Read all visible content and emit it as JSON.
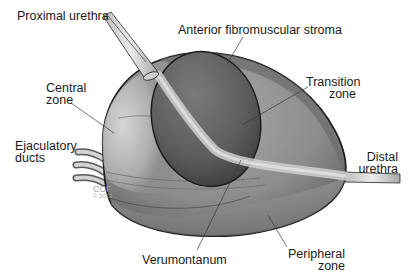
{
  "diagram": {
    "labels": {
      "proximal_urethra": "Proximal urethra",
      "anterior_fibromuscular_stroma": "Anterior fibromuscular stroma",
      "central_zone_line1": "Central",
      "central_zone_line2": "zone",
      "transition_zone_line1": "Transition",
      "transition_zone_line2": "zone",
      "ejaculatory_ducts_line1": "Ejaculatory",
      "ejaculatory_ducts_line2": "ducts",
      "distal_urethra_line1": "Distal",
      "distal_urethra_line2": "urethra",
      "verumontanum": "Verumontanum",
      "peripheral_zone_line1": "Peripheral",
      "peripheral_zone_line2": "zone"
    },
    "copyright": {
      "line1": "CCF",
      "line2": "© 2013"
    },
    "colors": {
      "outline": "#1e1e1e",
      "outer_gland": "#8a8a8a",
      "transition_zone": "#5a5a5a",
      "central_zone": "#b4b4b4",
      "urethra": "#d8d8d8",
      "leader_line": "#3a3a3a",
      "text": "#1a1a1a"
    }
  }
}
